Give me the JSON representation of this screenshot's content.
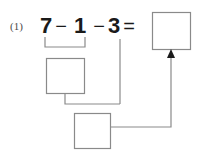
{
  "problem": {
    "number_label": "(1)",
    "equation": {
      "operand_1": "7",
      "operator_1": "−",
      "operand_2": "1",
      "operator_2": "−",
      "operand_3": "3",
      "equals": "="
    }
  },
  "answer_boxes": {
    "result_box": {
      "label": "result-answer-box",
      "value": ""
    },
    "first_step_box": {
      "label": "first-step-answer-box",
      "value": ""
    },
    "second_step_box": {
      "label": "second-step-answer-box",
      "value": ""
    }
  },
  "annotations": {
    "underbrace_label": "grouping-bracket-under-7-minus-1",
    "arrow_label": "arrow-into-result-box"
  },
  "colors": {
    "background": "#ffffff",
    "text": "#1a1a1a",
    "label_text": "#4a4a4a",
    "box_stroke": "#8a8a8a",
    "connector_stroke": "#8a8a8a",
    "arrow_fill": "#1a1a1a"
  }
}
